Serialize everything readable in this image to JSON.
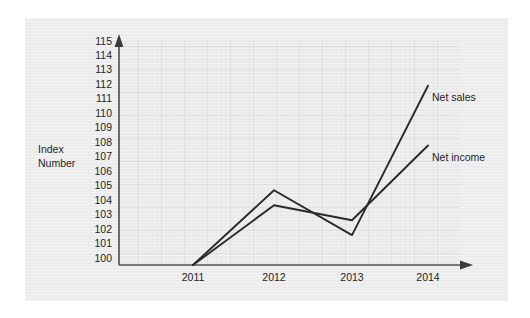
{
  "chart_data": {
    "type": "line",
    "title": "",
    "subtitle": "",
    "xlabel": "",
    "ylabel": "Index Number",
    "ylabel_line1": "Index",
    "ylabel_line2": "Number",
    "categories": [
      "2011",
      "2012",
      "2013",
      "2014"
    ],
    "x_tick_labels": [
      "2011",
      "2012",
      "2013",
      "2014"
    ],
    "y_tick_labels": [
      "115",
      "114",
      "113",
      "112",
      "111",
      "110",
      "109",
      "108",
      "107",
      "106",
      "105",
      "104",
      "103",
      "102",
      "101",
      "100"
    ],
    "ylim": [
      100,
      115
    ],
    "xlim": [
      "2011",
      "2014"
    ],
    "grid": true,
    "grid_style": "fine graph paper grid",
    "legend_position": "inline at line end",
    "series": [
      {
        "name": "Net sales",
        "values": [
          100,
          105,
          102,
          112
        ],
        "label": "Net sales",
        "color": "#2a2a2a"
      },
      {
        "name": "Net income",
        "values": [
          100,
          104,
          103,
          108
        ],
        "label": "Net income",
        "color": "#2a2a2a"
      }
    ],
    "annotations": [
      {
        "text": "Net sales",
        "at_x": "2014",
        "at_y": 112
      },
      {
        "text": "Net income",
        "at_x": "2014",
        "at_y": 108
      }
    ],
    "colors": {
      "panel_background": "#ececec",
      "grid_line": "#d8d8d8",
      "axis_line": "#4a4a4a",
      "series_line": "#2a2a2a",
      "text": "#1f1f1f"
    }
  }
}
